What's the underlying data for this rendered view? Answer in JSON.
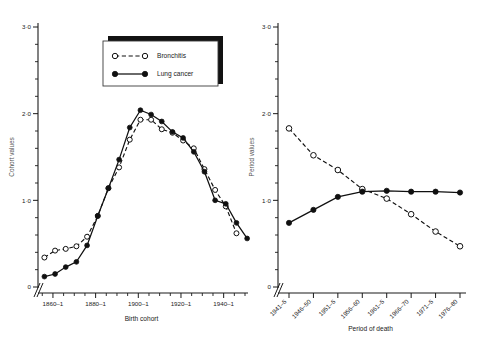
{
  "figure": {
    "background": "#ffffff",
    "ink_color": "#101010"
  },
  "legend": {
    "position": "upper-left-inside-left-panel",
    "entries": [
      {
        "label": "Bronchitis",
        "marker": "open-circle",
        "line": "dashed"
      },
      {
        "label": "Lung cancer",
        "marker": "filled-circle",
        "line": "solid"
      }
    ]
  },
  "chart_data": [
    {
      "type": "line",
      "panel": "left",
      "title": "",
      "xlabel": "Birth cohort",
      "ylabel": "Cohort values",
      "ylim": [
        0,
        3.0
      ],
      "ytick_labels": [
        "0",
        "1·0",
        "2·0",
        "3·0"
      ],
      "ytick_values": [
        0,
        1.0,
        2.0,
        3.0
      ],
      "y_minor_step": 0.2,
      "grid": false,
      "axis_break_x": true,
      "axis_break_y": false,
      "xtick_labels": [
        "1860–1",
        "1880–1",
        "1900–1",
        "1920–1",
        "1940–1"
      ],
      "xtick_values": [
        1860,
        1880,
        1900,
        1920,
        1940
      ],
      "x_minor_step": 5,
      "xlim": [
        1853,
        1950
      ],
      "categories": [
        1856,
        1861,
        1866,
        1871,
        1876,
        1881,
        1886,
        1891,
        1896,
        1901,
        1906,
        1911,
        1916,
        1921,
        1926,
        1931,
        1936,
        1941,
        1946
      ],
      "series": [
        {
          "name": "Bronchitis",
          "marker": "open-circle",
          "line": "dashed",
          "values": [
            0.34,
            0.42,
            0.44,
            0.47,
            0.58,
            0.82,
            1.14,
            1.38,
            1.7,
            1.93,
            1.93,
            1.82,
            1.78,
            1.69,
            1.6,
            1.36,
            1.12,
            0.93,
            0.62
          ]
        },
        {
          "name": "Lung cancer",
          "marker": "filled-circle",
          "line": "solid",
          "values": [
            0.12,
            0.15,
            0.23,
            0.29,
            0.48,
            0.82,
            1.14,
            1.47,
            1.84,
            2.04,
            1.99,
            1.91,
            1.79,
            1.72,
            1.56,
            1.33,
            1.0,
            0.96,
            0.74,
            0.56
          ]
        }
      ]
    },
    {
      "type": "line",
      "panel": "right",
      "title": "",
      "xlabel": "Period of death",
      "ylabel": "Period values",
      "ylim": [
        0,
        3.0
      ],
      "ytick_labels": [
        "0",
        "1·0",
        "2·0",
        "3·0"
      ],
      "ytick_values": [
        0,
        1.0,
        2.0,
        3.0
      ],
      "y_minor_step": 0.2,
      "grid": false,
      "axis_break_x": true,
      "categories": [
        "1941–5",
        "1946–50",
        "1951–5",
        "1956–60",
        "1961–5",
        "1966–70",
        "1971–5",
        "1976–80"
      ],
      "series": [
        {
          "name": "Bronchitis",
          "marker": "open-circle",
          "line": "dashed",
          "values": [
            1.83,
            1.52,
            1.35,
            1.13,
            1.02,
            0.84,
            0.64,
            0.47
          ]
        },
        {
          "name": "Lung cancer",
          "marker": "filled-circle",
          "line": "solid",
          "values": [
            0.74,
            0.89,
            1.04,
            1.1,
            1.11,
            1.1,
            1.1,
            1.09
          ]
        }
      ]
    }
  ]
}
